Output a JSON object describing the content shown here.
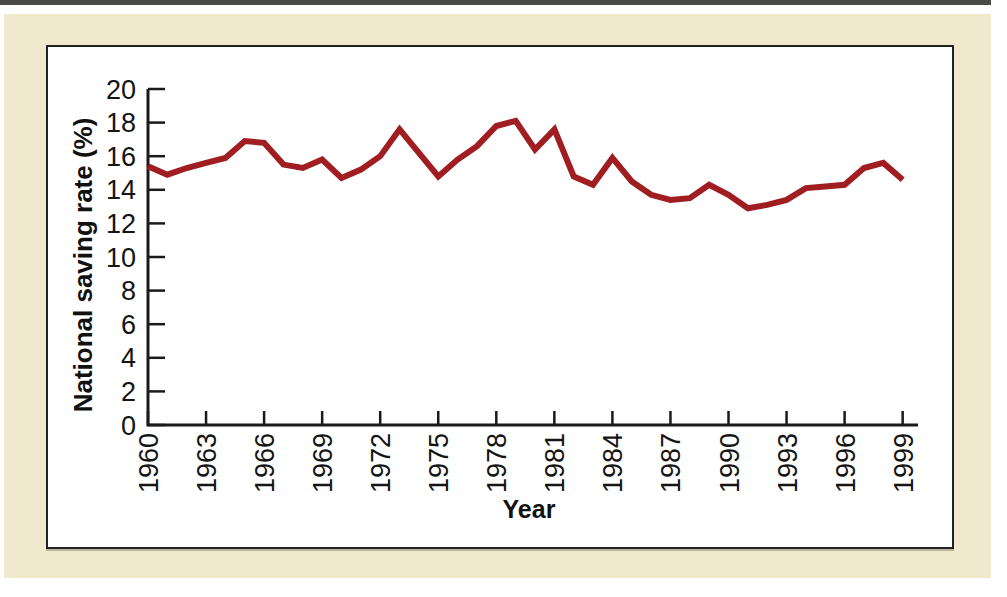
{
  "figure": {
    "page_background_color": "#f1e9cd",
    "panel_background_color": "#ffffff",
    "panel_border_color": "#222220",
    "top_edge_stripe_color": "#4a4a48",
    "axis_color": "#1a1a1a",
    "tick_label_color": "#141414"
  },
  "chart_data": {
    "type": "line",
    "title": "",
    "xlabel": "Year",
    "ylabel": "National saving rate (%)",
    "x": [
      1960,
      1961,
      1962,
      1963,
      1964,
      1965,
      1966,
      1967,
      1968,
      1969,
      1970,
      1971,
      1972,
      1973,
      1974,
      1975,
      1976,
      1977,
      1978,
      1979,
      1980,
      1981,
      1982,
      1983,
      1984,
      1985,
      1986,
      1987,
      1988,
      1989,
      1990,
      1991,
      1992,
      1993,
      1994,
      1995,
      1996,
      1997,
      1998,
      1999
    ],
    "series": [
      {
        "name": "National saving rate",
        "color": "#a01d21",
        "values": [
          15.4,
          14.9,
          15.3,
          15.6,
          15.9,
          16.9,
          16.8,
          15.5,
          15.3,
          15.8,
          14.7,
          15.2,
          16.0,
          17.6,
          16.2,
          14.8,
          15.8,
          16.6,
          17.8,
          18.1,
          16.4,
          17.6,
          14.8,
          14.3,
          15.9,
          14.5,
          13.7,
          13.4,
          13.5,
          14.3,
          13.7,
          12.9,
          13.1,
          13.4,
          14.1,
          14.2,
          14.3,
          15.3,
          15.6,
          14.6
        ]
      }
    ],
    "xlim": [
      1960,
      2000
    ],
    "ylim": [
      0,
      20
    ],
    "yticks": [
      0,
      2,
      4,
      6,
      8,
      10,
      12,
      14,
      16,
      18,
      20
    ],
    "xticks": [
      1960,
      1963,
      1966,
      1969,
      1972,
      1975,
      1978,
      1981,
      1984,
      1987,
      1990,
      1993,
      1996,
      1999
    ],
    "x_tick_label_rotation": 90,
    "tick_direction": "in",
    "grid": false,
    "legend": "none"
  }
}
